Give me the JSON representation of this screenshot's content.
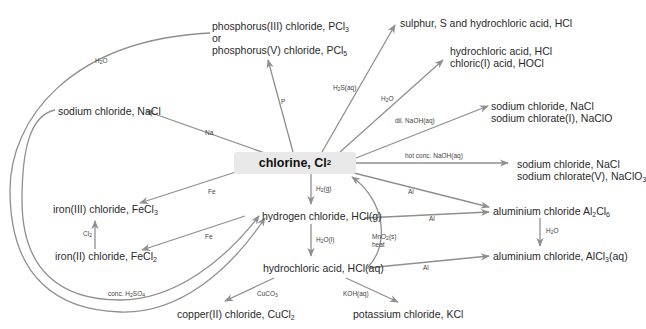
{
  "colors": {
    "line": "#8f8f8f",
    "center_bg": "#e9e9e9",
    "text": "#2a2a2a"
  },
  "center": {
    "text": "chlorine, Cl",
    "sub": "2"
  },
  "nodes": {
    "pcl": {
      "line1": "phosphorus(III) chloride, PCl",
      "line1_sub": "3",
      "line2": "or",
      "line3": "phosphorus(V) chloride, PCl",
      "line3_sub": "5"
    },
    "sulphur": {
      "line1": "sulphur, S and hydrochloric acid, HCl"
    },
    "hocl": {
      "line1": "hydrochloric acid, HCl",
      "line2": "chloric(I) acid, HOCl"
    },
    "naclo": {
      "line1": "sodium chloride, NaCl",
      "line2": "sodium chlorate(I), NaClO"
    },
    "naclo3": {
      "line1": "sodium chloride, NaCl",
      "line2": "sodium chlorate(V), NaClO",
      "line2_sub": "3"
    },
    "nacl": {
      "line1": "sodium chloride, NaCl"
    },
    "fecl3": {
      "line1": "iron(III) chloride, FeCl",
      "line1_sub": "3"
    },
    "fecl2": {
      "line1": "iron(II) chloride, FeCl",
      "line1_sub": "2"
    },
    "hclg": {
      "line1": "hydrogen chloride, HCl(g)"
    },
    "hclaq": {
      "line1": "hydrochloric acid, HCl(aq)"
    },
    "al2cl6": {
      "line1": "aluminium chloride Al",
      "sub1": "2",
      "mid": "Cl",
      "sub2": "6"
    },
    "alcl3": {
      "line1": "aluminium chloride, AlCl",
      "sub1": "3",
      "tail": "(aq)"
    },
    "cucl2": {
      "line1": "copper(II) chloride, CuCl",
      "line1_sub": "2"
    },
    "kcl": {
      "line1": "potassium chloride, KCl"
    }
  },
  "reagents": {
    "h2o_top": {
      "a": "H",
      "sub": "2",
      "b": "O"
    },
    "p": {
      "a": "P"
    },
    "na": {
      "a": "Na"
    },
    "h2s": {
      "a": "H",
      "sub": "2",
      "b": "S(aq)"
    },
    "h2o_hocl": {
      "a": "H",
      "sub": "2",
      "b": "O"
    },
    "dil_naoh": {
      "a": "dil. NaOH(aq)"
    },
    "hot_naoh": {
      "a": "hot conc. NaOH(aq)"
    },
    "fe_top": {
      "a": "Fe"
    },
    "fe_bottom": {
      "a": "Fe"
    },
    "cl2": {
      "a": "Cl",
      "sub": "2"
    },
    "h2g": {
      "a": "H",
      "sub": "2",
      "b": "(g)"
    },
    "al_cl2": {
      "a": "Al"
    },
    "al_hclg": {
      "a": "Al"
    },
    "al_hclaq": {
      "a": "Al"
    },
    "h2o_al": {
      "a": "H",
      "sub": "2",
      "b": "O"
    },
    "h2ol": {
      "a": "H",
      "sub": "2",
      "b": "O(l)"
    },
    "mno2": {
      "a": "MnO",
      "sub": "2",
      "b": "(s)",
      "c": "heat"
    },
    "conc_h2so4": {
      "a": "conc. H",
      "sub": "2",
      "b": "SO",
      "sub2": "4"
    },
    "cuco3": {
      "a": "CuCO",
      "sub": "3"
    },
    "koh": {
      "a": "KOH(aq)"
    }
  }
}
